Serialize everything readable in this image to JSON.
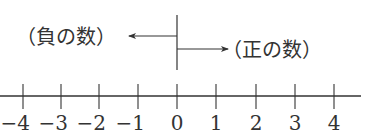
{
  "diagram": {
    "type": "number-line",
    "negative_label": "（負の数）",
    "positive_label": "（正の数）",
    "origin_value": 0,
    "ticks": [
      {
        "value": -4,
        "label": "−4",
        "x": 23
      },
      {
        "value": -3,
        "label": "−3",
        "x": 61
      },
      {
        "value": -2,
        "label": "−2",
        "x": 99
      },
      {
        "value": -1,
        "label": "−1",
        "x": 138
      },
      {
        "value": 0,
        "label": "0",
        "x": 177
      },
      {
        "value": 1,
        "label": "1",
        "x": 216
      },
      {
        "value": 2,
        "label": "2",
        "x": 256
      },
      {
        "value": 3,
        "label": "3",
        "x": 295
      },
      {
        "value": 4,
        "label": "4",
        "x": 334
      }
    ],
    "colors": {
      "ink": "#333333",
      "background": "#ffffff"
    }
  }
}
